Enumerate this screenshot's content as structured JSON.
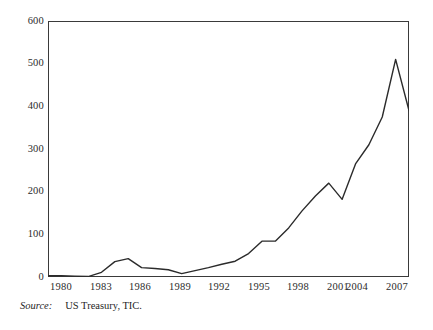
{
  "chart_data": {
    "type": "line",
    "title": "",
    "subtitle": "",
    "xlabel": "",
    "ylabel": "",
    "xlim": [
      1980,
      2007
    ],
    "ylim": [
      0,
      600
    ],
    "grid": false,
    "legend": false,
    "y_ticks": [
      600,
      500,
      400,
      300,
      200,
      100,
      0
    ],
    "x_ticks": [
      1980,
      1983,
      1986,
      1989,
      1992,
      1995,
      1998,
      2001,
      2004,
      2007
    ],
    "x": [
      1980,
      1981,
      1982,
      1983,
      1984,
      1985,
      1986,
      1987,
      1988,
      1989,
      1990,
      1991,
      1992,
      1993,
      1994,
      1995,
      1996,
      1997,
      1998,
      1999,
      2000,
      2001,
      2002,
      2003,
      2004,
      2005,
      2006,
      2007
    ],
    "series": [
      {
        "name": "US Treasury TIC",
        "color": "#2b2b2b",
        "values": [
          3,
          3,
          2,
          1,
          11,
          36,
          43,
          22,
          20,
          17,
          8,
          15,
          22,
          30,
          37,
          55,
          84,
          84,
          115,
          155,
          190,
          220,
          182,
          265,
          310,
          375,
          510,
          390
        ]
      }
    ]
  },
  "source": {
    "label": "Source:",
    "text": "US Treasury, TIC."
  }
}
